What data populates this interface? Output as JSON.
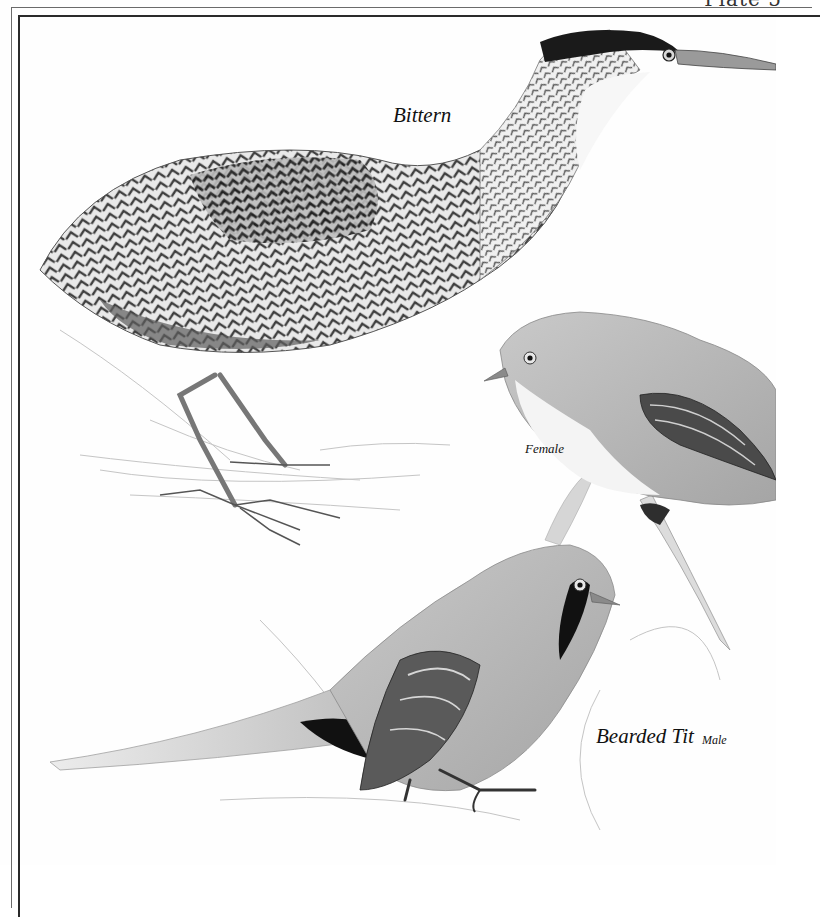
{
  "plate": {
    "header_partial": "Plate 5",
    "frame_color": "#2a2a2a"
  },
  "labels": {
    "bittern": "Bittern",
    "female": "Female",
    "bearded_tit": "Bearded Tit",
    "male": "Male"
  },
  "illustrations": [
    {
      "name": "bittern",
      "pose": "standing, neck outstretched, in reeds"
    },
    {
      "name": "bearded-tit-female",
      "pose": "perched on reed stem"
    },
    {
      "name": "bearded-tit-male",
      "pose": "perched, long tail extended"
    }
  ],
  "colors": {
    "background": "#fefefe",
    "ink_dark": "#1a1a1a",
    "plumage_mid": "#8a8a8a",
    "plumage_light": "#d4d4d4"
  }
}
